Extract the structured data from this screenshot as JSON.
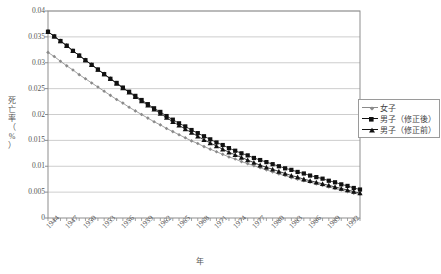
{
  "chart_data": {
    "type": "line",
    "title": "",
    "xlabel": "年",
    "ylabel": "死亡率（%）",
    "ylabel_chars": [
      "死",
      "亡",
      "率",
      "（",
      "%",
      "）"
    ],
    "xlim": [
      1944,
      1994
    ],
    "ylim": [
      0,
      0.04
    ],
    "grid": true,
    "grid_axis": "y",
    "legend_position": "right",
    "y_ticks": [
      "0.04",
      "0.035",
      "0.03",
      "0.025",
      "0.02",
      "0.015",
      "0.01",
      "0.005",
      "0"
    ],
    "y_tick_values": [
      0.04,
      0.035,
      0.03,
      0.025,
      0.02,
      0.015,
      0.01,
      0.005,
      0
    ],
    "x_tick_labels": [
      "1944",
      "1947",
      "1950",
      "1953",
      "1956",
      "1959",
      "1962",
      "1965",
      "1968",
      "1971",
      "1974",
      "1977",
      "1980",
      "1983",
      "1986",
      "1989",
      "1992"
    ],
    "x_tick_values": [
      1944,
      1947,
      1950,
      1953,
      1956,
      1959,
      1962,
      1965,
      1968,
      1971,
      1974,
      1977,
      1980,
      1983,
      1986,
      1989,
      1992
    ],
    "x": [
      1944,
      1945,
      1946,
      1947,
      1948,
      1949,
      1950,
      1951,
      1952,
      1953,
      1954,
      1955,
      1956,
      1957,
      1958,
      1959,
      1960,
      1961,
      1962,
      1963,
      1964,
      1965,
      1966,
      1967,
      1968,
      1969,
      1970,
      1971,
      1972,
      1973,
      1974,
      1975,
      1976,
      1977,
      1978,
      1979,
      1980,
      1981,
      1982,
      1983,
      1984,
      1985,
      1986,
      1987,
      1988,
      1989,
      1990,
      1991,
      1992,
      1993,
      1994
    ],
    "series": [
      {
        "name": "女子",
        "marker": "small-diamond",
        "color": "#8a8a8a",
        "values": [
          0.032,
          0.0312,
          0.0303,
          0.0294,
          0.0286,
          0.0277,
          0.0269,
          0.0261,
          0.0253,
          0.0245,
          0.0237,
          0.0229,
          0.0222,
          0.0214,
          0.0207,
          0.02,
          0.0193,
          0.0186,
          0.018,
          0.0173,
          0.0167,
          0.0161,
          0.0155,
          0.0149,
          0.0144,
          0.0138,
          0.0133,
          0.0128,
          0.0123,
          0.0118,
          0.0114,
          0.0109,
          0.0105,
          0.0101,
          0.0097,
          0.0093,
          0.0089,
          0.0085,
          0.0082,
          0.0078,
          0.0075,
          0.0072,
          0.0069,
          0.0066,
          0.0063,
          0.006,
          0.0057,
          0.0054,
          0.0051,
          0.0048,
          0.0046
        ],
        "units": "%"
      },
      {
        "name": "男子（修正後）",
        "marker": "filled-square",
        "color": "#111111",
        "values": [
          0.036,
          0.0351,
          0.0342,
          0.0333,
          0.0323,
          0.0314,
          0.0305,
          0.0296,
          0.0287,
          0.0278,
          0.0269,
          0.0261,
          0.0252,
          0.0244,
          0.0236,
          0.0228,
          0.022,
          0.0212,
          0.0205,
          0.0197,
          0.019,
          0.0183,
          0.0177,
          0.017,
          0.0164,
          0.0158,
          0.0152,
          0.0146,
          0.0141,
          0.0135,
          0.013,
          0.0125,
          0.0121,
          0.0116,
          0.0112,
          0.0108,
          0.0104,
          0.01,
          0.0096,
          0.0093,
          0.0089,
          0.0086,
          0.0082,
          0.0079,
          0.0076,
          0.0072,
          0.0069,
          0.0065,
          0.0062,
          0.0058,
          0.0055
        ],
        "units": "%"
      },
      {
        "name": "男子（修正前）",
        "marker": "filled-triangle",
        "color": "#111111",
        "values": [
          0.036,
          0.0351,
          0.0342,
          0.0333,
          0.0323,
          0.0314,
          0.0305,
          0.0296,
          0.0287,
          0.0278,
          0.0269,
          0.026,
          0.0251,
          0.0243,
          0.0234,
          0.0226,
          0.0218,
          0.021,
          0.0202,
          0.0194,
          0.0186,
          0.0179,
          0.0172,
          0.0165,
          0.0158,
          0.0151,
          0.0145,
          0.0139,
          0.0133,
          0.0127,
          0.0122,
          0.0117,
          0.0112,
          0.0107,
          0.0102,
          0.0098,
          0.0094,
          0.009,
          0.0086,
          0.0082,
          0.0079,
          0.0075,
          0.0072,
          0.0069,
          0.0066,
          0.0063,
          0.006,
          0.0057,
          0.0054,
          0.0051,
          0.0048
        ],
        "units": "%"
      }
    ]
  },
  "legend": {
    "items": [
      {
        "label": "女子",
        "marker": "small-diamond",
        "color": "#8a8a8a"
      },
      {
        "label": "男子（修正後）",
        "marker": "filled-square",
        "color": "#111111"
      },
      {
        "label": "男子（修正前）",
        "marker": "filled-triangle",
        "color": "#111111"
      }
    ]
  },
  "axes": {
    "plot_left": 48,
    "plot_right": 360,
    "plot_top": 11,
    "plot_bottom": 218,
    "frame_color": "#8d8d8d",
    "grid_color": "#b8b8b8"
  }
}
